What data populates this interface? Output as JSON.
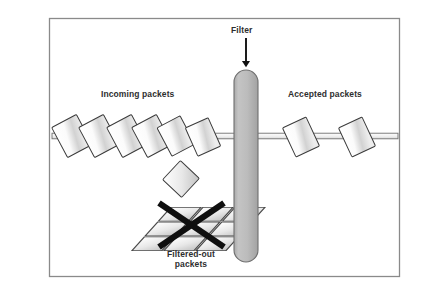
{
  "figure": {
    "frame": {
      "border_color": "#8a8a8a",
      "background_color": "#ffffff",
      "x": 49,
      "y": 18,
      "width": 351,
      "height": 259
    },
    "labels": {
      "filter": "Filter",
      "incoming": "Incoming packets",
      "accepted": "Accepted packets",
      "filtered_out_line1": "Filtered-out",
      "filtered_out_line2": "packets"
    },
    "colors": {
      "text": "#2e2e2e",
      "filter_fill": "#b9b9b9",
      "filter_stroke": "#6f6f6f",
      "packet_stroke": "#3a3a3a",
      "packet_fill_light": "#ffffff",
      "packet_fill_dark": "#bfbfbf",
      "wire_stroke": "#6b6b6b",
      "wire_fill": "#f2f2f2",
      "cross_mark": "#101010",
      "arrow": "#111111"
    },
    "elements": {
      "filter_bar": {
        "name": "filter-bar",
        "x": 234,
        "y": 70,
        "width": 24,
        "height": 192,
        "radius": 12
      },
      "arrow": {
        "name": "filter-arrow",
        "from_y": 38,
        "to_y": 68,
        "x": 246
      },
      "wire": {
        "name": "packet-wire",
        "y": 136,
        "x_start": 52,
        "x_end": 398,
        "thickness": 6
      },
      "incoming_packets": {
        "count": 6,
        "side": "left",
        "x_positions": [
          72,
          98,
          124,
          150,
          175,
          200
        ]
      },
      "accepted_packets": {
        "count": 2,
        "side": "right",
        "x_positions": [
          300,
          355
        ]
      },
      "falling_packet": {
        "count": 1,
        "x": 180,
        "y": 178
      },
      "filtered_pile": {
        "count": 6,
        "x": 190,
        "y": 222,
        "cross_over": true
      }
    }
  }
}
